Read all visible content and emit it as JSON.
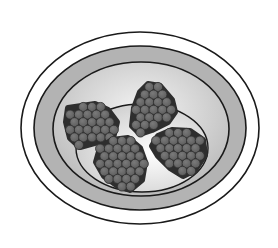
{
  "image": {
    "subject": "Bowl containing four clusters of berries",
    "style": "grayscale illustration",
    "alt_text": "A shallow bowl viewed from above with four round clusters of small dark spheres resting inside"
  },
  "colors": {
    "background": "#ffffff",
    "outline": "#1a1a1a",
    "outer_rim": "#ffffff",
    "rim_band": "#b3b3b3",
    "bowl_inner_light": "#f4f4f4",
    "bowl_inner_dark": "#bdbdbd",
    "platform_light": "#ffffff",
    "platform_dark": "#cfcfcf",
    "berry_fill": "#5e5e5e",
    "berry_highlight": "#7a7a7a",
    "berry_edge": "#2e2e2e"
  },
  "bowl": {
    "label": "bowl"
  },
  "clusters": [
    {
      "name": "cluster-left",
      "label": "berry cluster"
    },
    {
      "name": "cluster-top",
      "label": "berry cluster"
    },
    {
      "name": "cluster-bottom",
      "label": "berry cluster"
    },
    {
      "name": "cluster-right",
      "label": "berry cluster"
    }
  ]
}
